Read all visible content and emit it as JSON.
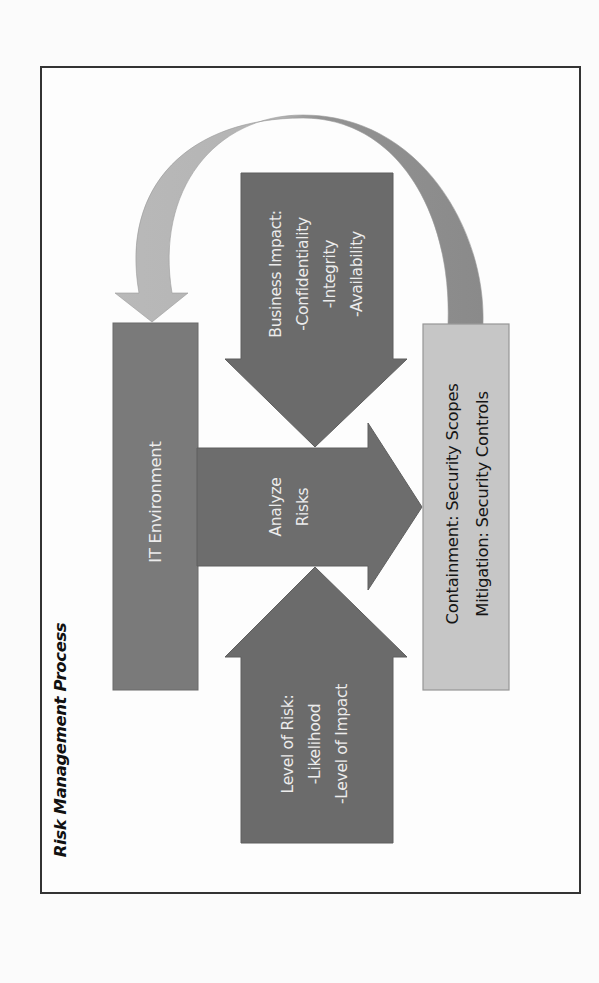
{
  "title": "Risk Management Process",
  "colors": {
    "frame_border": "#333333",
    "box_dark": "#7a7a7a",
    "arrow_dark": "#6b6b6b",
    "box_light": "#c6c6c6",
    "curve_light": "#b7b7b7",
    "curve_dark": "#8c8c8c",
    "text_light": "#ececec",
    "text_dark": "#151515"
  },
  "nodes": {
    "it_environment": {
      "label": "IT Environment"
    },
    "analyze_risks": {
      "lines": [
        "Analyze",
        "Risks"
      ]
    },
    "business_impact": {
      "lines": [
        "Business Impact:",
        "-Confidentiality",
        "-Integrity",
        "-Availability"
      ]
    },
    "level_of_risk": {
      "lines": [
        "Level of Risk:",
        "-Likelihood",
        "-Level of Impact"
      ]
    },
    "outcome": {
      "lines": [
        "Containment: Security Scopes",
        "Mitigation: Security Controls"
      ]
    }
  },
  "edges": [
    {
      "from": "it_environment",
      "to": "outcome",
      "label": "Analyze Risks",
      "shape": "block-arrow"
    },
    {
      "from": "business_impact",
      "to": "analyze_risks",
      "shape": "block-arrow"
    },
    {
      "from": "level_of_risk",
      "to": "analyze_risks",
      "shape": "block-arrow"
    },
    {
      "from": "outcome",
      "to": "it_environment",
      "shape": "curved-arrow"
    }
  ]
}
